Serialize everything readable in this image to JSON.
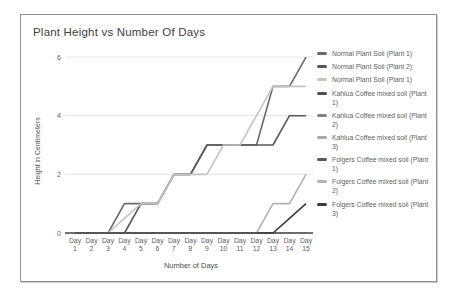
{
  "chart_data": {
    "type": "line",
    "title": "Plant Height vs Number Of Days",
    "xlabel": "Number of Days",
    "ylabel": "Height in Centimeters",
    "ylim": [
      0,
      6
    ],
    "yticks": [
      0,
      2,
      4,
      6
    ],
    "grid": true,
    "legend_position": "right",
    "categories": [
      "Day 1",
      "Day 2",
      "Day 3",
      "Day 4",
      "Day 5",
      "Day 6",
      "Day 7",
      "Day 8",
      "Day 9",
      "Day 10",
      "Day 11",
      "Day 12",
      "Day 13",
      "Day 14",
      "Day 15"
    ],
    "series": [
      {
        "name": "Normal Plant Soil (Plant 1)",
        "color": "#6a6a6a",
        "values": [
          0,
          0,
          0,
          1,
          1,
          1,
          2,
          2,
          3,
          3,
          3,
          3,
          5,
          5,
          6
        ]
      },
      {
        "name": "Normal Plant Soil (Plant 2)",
        "color": "#585858",
        "values": [
          0,
          0,
          0,
          0,
          1,
          1,
          2,
          2,
          3,
          3,
          3,
          3,
          3,
          4,
          4
        ]
      },
      {
        "name": "Normal Plant Soil (Plant 1)",
        "color": "#c4c4c4",
        "values": [
          0,
          0,
          0,
          0.5,
          1,
          1,
          2,
          2,
          2,
          3,
          3,
          4,
          5,
          5,
          5
        ]
      },
      {
        "name": "Kahlua Coffee mixed soil (Plant 1)",
        "color": "#4e4e4e",
        "values": [
          0,
          0,
          0,
          0,
          0,
          0,
          0,
          0,
          0,
          0,
          0,
          0,
          0,
          0,
          0
        ]
      },
      {
        "name": "Kahlua Coffee mixed soil (Plant 2)",
        "color": "#838383",
        "values": [
          0,
          0,
          0,
          0,
          0,
          0,
          0,
          0,
          0,
          0,
          0,
          0,
          0,
          0,
          0
        ]
      },
      {
        "name": "Kahlua Coffee mixed soil (Plant 3)",
        "color": "#a8a8a8",
        "values": [
          0,
          0,
          0,
          0,
          0,
          0,
          0,
          0,
          0,
          0,
          0,
          0,
          0,
          0,
          0
        ]
      },
      {
        "name": "Folgers Coffee mixed soil (Plant 1)",
        "color": "#5a5a5a",
        "values": [
          0,
          0,
          0,
          0,
          0,
          0,
          0,
          0,
          0,
          0,
          0,
          0,
          0,
          0,
          0
        ]
      },
      {
        "name": "Folgers Coffee mixed soil (Plant 2)",
        "color": "#b2b2b2",
        "values": [
          0,
          0,
          0,
          0,
          0,
          0,
          0,
          0,
          0,
          0,
          0,
          0,
          1,
          1,
          2
        ]
      },
      {
        "name": "Folgers Coffee mixed soil (Plant 3)",
        "color": "#3c3c3c",
        "values": [
          0,
          0,
          0,
          0,
          0,
          0,
          0,
          0,
          0,
          0,
          0,
          0,
          0,
          0.5,
          1
        ]
      }
    ]
  },
  "colors": {
    "card_border": "#8f8f8f",
    "title_text": "#3f3f3f",
    "tick_text": "#616161",
    "gridline": "#e4e4e4",
    "baseline": "#424242",
    "background": "#ffffff"
  }
}
